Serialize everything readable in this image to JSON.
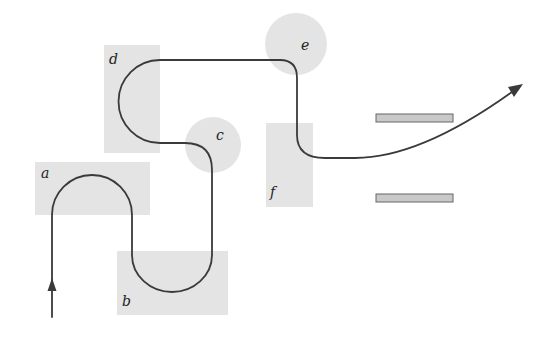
{
  "diagram": {
    "type": "path-through-regions",
    "background": "#ffffff",
    "region_color": "#e4e4e4",
    "line_color": "#3a3a3a",
    "bar_color": "#c9c9c9",
    "regions": [
      {
        "id": "a",
        "label": "a",
        "shape": "rect"
      },
      {
        "id": "b",
        "label": "b",
        "shape": "rect"
      },
      {
        "id": "c",
        "label": "c",
        "shape": "circle"
      },
      {
        "id": "d",
        "label": "d",
        "shape": "rect"
      },
      {
        "id": "e",
        "label": "e",
        "shape": "circle"
      },
      {
        "id": "f",
        "label": "f",
        "shape": "rect"
      }
    ],
    "bars": [
      {
        "id": "bar-top"
      },
      {
        "id": "bar-bottom"
      }
    ],
    "path": {
      "start_arrow": "up",
      "end_arrow": "up-right",
      "sequence": [
        "a",
        "b",
        "c",
        "d",
        "e",
        "f"
      ]
    }
  }
}
